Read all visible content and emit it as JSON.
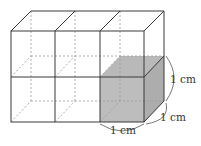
{
  "diagram": {
    "type": "cuboid-of-unit-cubes",
    "cubes_wide": 3,
    "cubes_high": 2,
    "cubes_deep": 1,
    "shaded_cube": "bottom-right-front",
    "colors": {
      "line": "#3a3a3a",
      "hidden_line": "#9a9a9a",
      "shade": "#b8b8b8",
      "shade_side": "#a9a9a9",
      "label": "#333333"
    },
    "labels": {
      "height": "1 cm",
      "depth": "1 cm",
      "width": "1 cm"
    }
  }
}
